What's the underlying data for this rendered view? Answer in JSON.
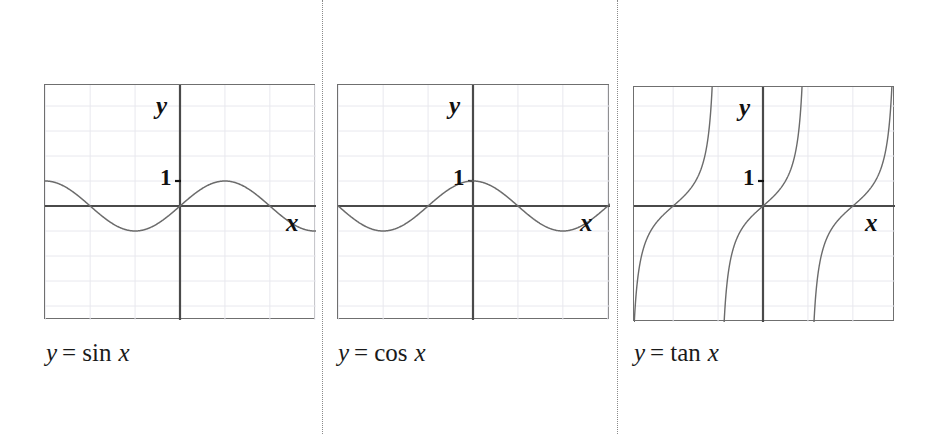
{
  "figure": {
    "background_color": "#ffffff",
    "width": 931,
    "height": 434,
    "separator_color": "#8a8a8a",
    "axis_color": "#4a4a4a",
    "grid_color": "#e8e8ee",
    "curve_color": "#6b6b6b",
    "frame_color": "#6f6f6f"
  },
  "separators": [
    {
      "name": "separator-1",
      "x": 322
    },
    {
      "name": "separator-2",
      "x": 617
    }
  ],
  "panels": [
    {
      "id": "sine",
      "caption_y": "y",
      "caption_eq": "=",
      "caption_fn": "sin",
      "caption_x": "x",
      "caption_full": "y = sin x",
      "y_axis_label": "y",
      "x_axis_label": "x",
      "tick_label": "1",
      "frame": {
        "left": 44,
        "top": 84,
        "width": 271,
        "height": 235
      },
      "origin": {
        "x": 135,
        "y": 121
      },
      "unit_y": 25,
      "unit_x": 28.6
    },
    {
      "id": "cosine",
      "caption_y": "y",
      "caption_eq": "=",
      "caption_fn": "cos",
      "caption_x": "x",
      "caption_full": "y = cos x",
      "y_axis_label": "y",
      "x_axis_label": "x",
      "tick_label": "1",
      "frame": {
        "left": 337,
        "top": 84,
        "width": 272,
        "height": 235
      },
      "origin": {
        "x": 135,
        "y": 121
      },
      "unit_y": 25,
      "unit_x": 28.6
    },
    {
      "id": "tangent",
      "caption_y": "y",
      "caption_eq": "=",
      "caption_fn": "tan",
      "caption_x": "x",
      "caption_full": "y = tan x",
      "y_axis_label": "y",
      "x_axis_label": "x",
      "tick_label": "1",
      "frame": {
        "left": 633,
        "top": 86,
        "width": 261,
        "height": 235
      },
      "origin": {
        "x": 129,
        "y": 119
      },
      "unit_y": 25,
      "unit_x": 28.6
    }
  ],
  "captions": [
    {
      "name": "caption-sine",
      "text": "y = sin x",
      "left": 46,
      "top": 340
    },
    {
      "name": "caption-cosine",
      "text": "y = cos x",
      "left": 338,
      "top": 340
    },
    {
      "name": "caption-tangent",
      "text": "y = tan x",
      "left": 634,
      "top": 340
    }
  ],
  "chart_data": {
    "type": "line",
    "title": "",
    "charts": [
      {
        "id": "sine",
        "title": "y = sin x",
        "function": "sin",
        "equation": "y = sin x",
        "xlabel": "x",
        "ylabel": "y",
        "yticks": [
          1
        ],
        "ytick_labels": [
          "1"
        ],
        "xlim": [
          -4.72,
          6.29
        ],
        "ylim": [
          -4.84,
          4.56
        ],
        "amplitude": 1,
        "period": 6.283,
        "grid": true,
        "grid_spacing_x": 1.571,
        "grid_spacing_y": 1,
        "zeros": [
          -4.712,
          -3.142,
          0,
          3.142,
          6.283
        ],
        "maxima": [
          {
            "x": 1.571,
            "y": 1
          }
        ],
        "minima": [
          {
            "x": -1.571,
            "y": -1
          },
          {
            "x": 4.712,
            "y": -1
          }
        ],
        "samples_x": [
          -4.72,
          -4.0,
          -3.14,
          -2.36,
          -1.57,
          -0.79,
          0,
          0.79,
          1.57,
          2.36,
          3.14,
          3.93,
          4.71,
          5.5,
          6.28
        ],
        "samples_y": [
          1.0,
          0.757,
          0.0,
          -0.707,
          -1.0,
          -0.707,
          0.0,
          0.707,
          1.0,
          0.707,
          0.0,
          -0.707,
          -1.0,
          -0.707,
          0.0
        ]
      },
      {
        "id": "cosine",
        "title": "y = cos x",
        "function": "cos",
        "equation": "y = cos x",
        "xlabel": "x",
        "ylabel": "y",
        "yticks": [
          1
        ],
        "ytick_labels": [
          "1"
        ],
        "xlim": [
          -4.72,
          6.33
        ],
        "ylim": [
          -4.84,
          4.56
        ],
        "amplitude": 1,
        "period": 6.283,
        "grid": true,
        "grid_spacing_x": 1.571,
        "grid_spacing_y": 1,
        "zeros": [
          -4.712,
          -1.571,
          1.571,
          4.712
        ],
        "maxima": [
          {
            "x": 0,
            "y": 1
          },
          {
            "x": 6.283,
            "y": 1
          }
        ],
        "minima": [
          {
            "x": -3.142,
            "y": -1
          },
          {
            "x": 3.142,
            "y": -1
          }
        ],
        "samples_x": [
          -4.72,
          -4.0,
          -3.14,
          -2.36,
          -1.57,
          -0.79,
          0,
          0.79,
          1.57,
          2.36,
          3.14,
          3.93,
          4.71,
          5.5,
          6.28
        ],
        "samples_y": [
          0.0,
          -0.654,
          -1.0,
          -0.707,
          0.0,
          0.707,
          1.0,
          0.707,
          0.0,
          -0.707,
          -1.0,
          -0.707,
          0.0,
          0.707,
          1.0
        ]
      },
      {
        "id": "tangent",
        "title": "y = tan x",
        "function": "tan",
        "equation": "y = tan x",
        "xlabel": "x",
        "ylabel": "y",
        "yticks": [
          1
        ],
        "ytick_labels": [
          "1"
        ],
        "xlim": [
          -4.51,
          4.62
        ],
        "ylim": [
          -4.76,
          4.76
        ],
        "period": 3.142,
        "grid": true,
        "grid_spacing_x": 1.571,
        "grid_spacing_y": 1,
        "asymptotes": [
          -4.712,
          -1.571,
          1.571,
          4.712
        ],
        "zeros": [
          -3.142,
          0,
          3.142
        ],
        "branches": 3
      }
    ]
  }
}
